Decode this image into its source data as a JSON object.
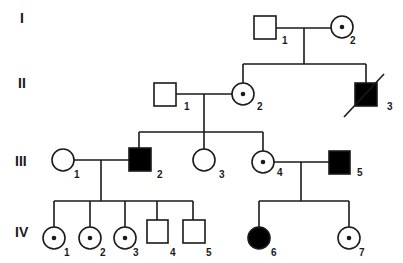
{
  "diagram": {
    "type": "pedigree",
    "generations": [
      "I",
      "II",
      "III",
      "IV"
    ],
    "legend_semantics": {
      "square": "male",
      "circle": "female",
      "filled": "affected",
      "dot": "carrier",
      "slash": "deceased"
    },
    "individuals": {
      "I": [
        {
          "id": "1",
          "sex": "male",
          "status": "unaffected"
        },
        {
          "id": "2",
          "sex": "female",
          "status": "carrier"
        }
      ],
      "II": [
        {
          "id": "1",
          "sex": "male",
          "status": "unaffected"
        },
        {
          "id": "2",
          "sex": "female",
          "status": "carrier"
        },
        {
          "id": "3",
          "sex": "male",
          "status": "affected",
          "deceased": true
        }
      ],
      "III": [
        {
          "id": "1",
          "sex": "female",
          "status": "unaffected"
        },
        {
          "id": "2",
          "sex": "male",
          "status": "affected"
        },
        {
          "id": "3",
          "sex": "female",
          "status": "unaffected"
        },
        {
          "id": "4",
          "sex": "female",
          "status": "carrier"
        },
        {
          "id": "5",
          "sex": "male",
          "status": "affected"
        }
      ],
      "IV": [
        {
          "id": "1",
          "sex": "female",
          "status": "carrier"
        },
        {
          "id": "2",
          "sex": "female",
          "status": "carrier"
        },
        {
          "id": "3",
          "sex": "female",
          "status": "carrier"
        },
        {
          "id": "4",
          "sex": "male",
          "status": "unaffected"
        },
        {
          "id": "5",
          "sex": "male",
          "status": "unaffected"
        },
        {
          "id": "6",
          "sex": "female",
          "status": "affected"
        },
        {
          "id": "7",
          "sex": "female",
          "status": "carrier"
        }
      ]
    },
    "colors": {
      "stroke": "#1a1a1a",
      "fill_affected": "#000000",
      "background": "#ffffff"
    }
  }
}
